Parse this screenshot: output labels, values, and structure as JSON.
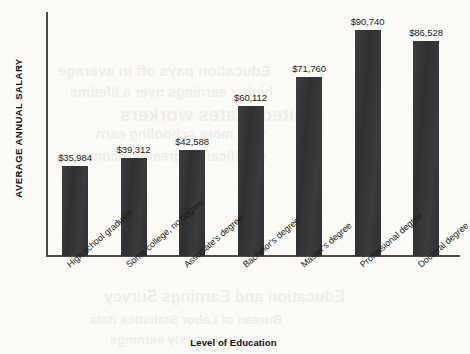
{
  "chart_data": {
    "type": "bar",
    "title": "",
    "xlabel": "Level of Education",
    "ylabel": "AVERAGE ANNUAL SALARY",
    "categories": [
      "High school graduate",
      "Some college, no degree",
      "Associate's degree",
      "Bachelor's degree",
      "Master's degree",
      "Professional degree",
      "Doctoral degree"
    ],
    "values": [
      35984,
      39312,
      42588,
      60112,
      71760,
      90740,
      86528
    ],
    "value_labels": [
      "$35,984",
      "$39,312",
      "$42,588",
      "$60,112",
      "$71,760",
      "$90,740",
      "$86,528"
    ],
    "ylim": [
      0,
      98000
    ],
    "grid": false,
    "legend": false,
    "bar_color": "#333234",
    "axis_color": "#4a4a4a",
    "background_color": "#fbfaf7"
  },
  "bleed_text": [
    {
      "text": "Education pays off in average",
      "x": 58,
      "y": 62,
      "size": 15
    },
    {
      "text": "higher earnings over a lifetime",
      "x": 70,
      "y": 84,
      "size": 14
    },
    {
      "text": "United States workers",
      "x": 120,
      "y": 104,
      "size": 19
    },
    {
      "text": "with more schooling earn",
      "x": 96,
      "y": 126,
      "size": 14
    },
    {
      "text": "significantly greater incomes",
      "x": 74,
      "y": 148,
      "size": 14
    },
    {
      "text": "Education and Earnings Survey",
      "x": 104,
      "y": 288,
      "size": 16
    },
    {
      "text": "Bureau of Labor Statistics data",
      "x": 90,
      "y": 312,
      "size": 13
    },
    {
      "text": "median weekly earnings",
      "x": 110,
      "y": 332,
      "size": 13
    }
  ]
}
